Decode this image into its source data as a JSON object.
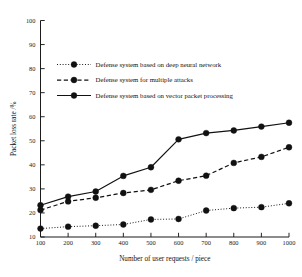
{
  "chart_data": {
    "type": "line",
    "title": "",
    "xlabel": "Number of user requests / piece",
    "ylabel": "Packet loss rate /%",
    "x": [
      100,
      200,
      300,
      400,
      500,
      600,
      700,
      800,
      900,
      1000
    ],
    "xticklabels": [
      "100",
      "200",
      "300",
      "400",
      "500",
      "600",
      "700",
      "800",
      "900",
      "1000"
    ],
    "yticks": [
      10,
      20,
      30,
      40,
      50,
      60,
      70,
      80,
      90,
      100
    ],
    "yticklabels": [
      "10",
      "20",
      "30",
      "40",
      "50",
      "60",
      "70",
      "80",
      "90",
      "100"
    ],
    "xlim": [
      100,
      1000
    ],
    "ylim": [
      10,
      100
    ],
    "grid": false,
    "legend_position": "upper-left",
    "series": [
      {
        "name": "Defense system based on deep neural network",
        "linestyle": "dotted",
        "marker": "circle",
        "color": "#111111",
        "values": [
          13.5,
          14.3,
          14.7,
          15.2,
          17.3,
          17.5,
          21.0,
          22.0,
          22.4,
          24.0
        ]
      },
      {
        "name": "Defense system for multiple attacks",
        "linestyle": "dashed",
        "marker": "circle",
        "color": "#111111",
        "values": [
          21.2,
          24.8,
          26.3,
          28.3,
          29.6,
          33.4,
          35.5,
          40.8,
          43.3,
          47.3
        ]
      },
      {
        "name": "Defense system based on vector packet processing",
        "linestyle": "solid",
        "marker": "circle",
        "color": "#111111",
        "values": [
          23.2,
          26.8,
          28.9,
          35.4,
          39.0,
          50.6,
          53.2,
          54.3,
          55.9,
          57.5
        ]
      }
    ]
  }
}
